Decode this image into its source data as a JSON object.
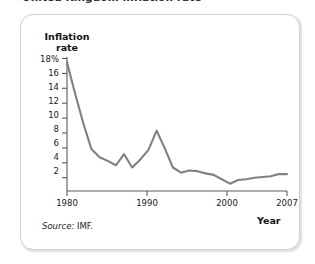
{
  "figure": {
    "clipped_title": "United Kingdom inflation rate",
    "inflation_axis_label_line1": "Inflation",
    "inflation_axis_label_line2": "rate",
    "year_axis_label": "Year",
    "source_word": "Source:",
    "source_value": "IMF.",
    "line_color": "#808080",
    "axis_color": "#5a5a5a",
    "frame_color": "#cfcfcf"
  },
  "chart_data": {
    "type": "line",
    "title": "United Kingdom inflation rate",
    "xlabel": "Year",
    "ylabel": "Inflation rate",
    "ylim": [
      0,
      18
    ],
    "xlim": [
      1980,
      2007
    ],
    "grid": false,
    "legend": false,
    "ytick_labels": [
      "18%",
      "16",
      "14",
      "12",
      "10",
      "8",
      "6",
      "4",
      "2"
    ],
    "ytick_values": [
      18,
      16,
      14,
      12,
      10,
      8,
      6,
      4,
      2
    ],
    "xtick_labels": [
      "1980",
      "1990",
      "2000",
      "2007"
    ],
    "xtick_values": [
      1980,
      1990,
      2000,
      2007
    ],
    "series": [
      {
        "name": "Inflation rate",
        "color": "#808080",
        "x": [
          1980,
          1981,
          1982,
          1983,
          1984,
          1985,
          1986,
          1987,
          1988,
          1989,
          1990,
          1991,
          1992,
          1993,
          1994,
          1995,
          1996,
          1997,
          1998,
          1999,
          2000,
          2001,
          2002,
          2003,
          2004,
          2005,
          2006,
          2007
        ],
        "values": [
          17.5,
          13.2,
          9.2,
          5.7,
          4.6,
          4.1,
          3.5,
          5.0,
          3.2,
          4.3,
          5.6,
          8.2,
          5.8,
          3.2,
          2.5,
          2.8,
          2.7,
          2.4,
          2.2,
          1.6,
          1.0,
          1.5,
          1.6,
          1.8,
          1.9,
          2.0,
          2.3,
          2.3
        ]
      }
    ],
    "source": "Source: IMF."
  }
}
